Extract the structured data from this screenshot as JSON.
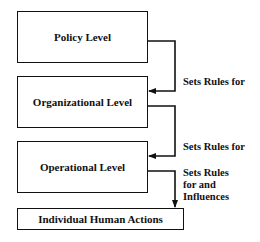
{
  "diagram": {
    "boxes": [
      {
        "label": "Policy Level"
      },
      {
        "label": "Organizational Level"
      },
      {
        "label": "Operational Level"
      },
      {
        "label": "Individual Human Actions"
      }
    ],
    "edges": [
      {
        "from": "Policy Level",
        "to": "Organizational Level",
        "label": "Sets Rules for"
      },
      {
        "from": "Organizational Level",
        "to": "Operational Level",
        "label": "Sets Rules for"
      },
      {
        "from": "Operational Level",
        "to": "Individual Human Actions",
        "label": "Sets Rules\nfor and\nInfluences"
      }
    ]
  }
}
